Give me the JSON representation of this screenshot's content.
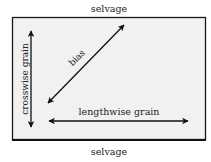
{
  "diagram": {
    "type": "fabric-grain-diagram",
    "labels": {
      "top": "selvage",
      "bottom": "selvage",
      "bias": "bias",
      "crosswise": "crosswise grain",
      "lengthwise": "lengthwise grain"
    },
    "colors": {
      "fabric_fill": "#f1f1f1",
      "border": "#1a1a1a",
      "arrow": "#111111",
      "text": "#222222"
    },
    "arrows": [
      {
        "name": "bias",
        "from": [
          48,
          103
        ],
        "to": [
          124,
          25
        ],
        "double_headed": true
      },
      {
        "name": "crosswise grain",
        "from": [
          31,
          31
        ],
        "to": [
          31,
          127
        ],
        "double_headed": true
      },
      {
        "name": "lengthwise grain",
        "from": [
          49,
          121
        ],
        "to": [
          188,
          121
        ],
        "double_headed": true
      }
    ]
  }
}
